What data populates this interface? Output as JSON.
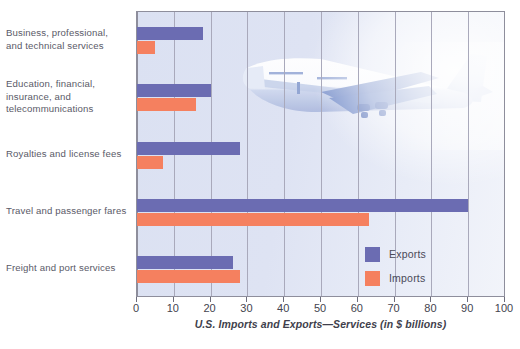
{
  "chart_data": {
    "type": "bar",
    "orientation": "horizontal",
    "title": "",
    "xlabel": "U.S. Imports and Exports—Services (in $ billions)",
    "ylabel": "",
    "xlim": [
      0,
      100
    ],
    "xticks": [
      0,
      10,
      20,
      30,
      40,
      50,
      60,
      70,
      80,
      90,
      100
    ],
    "xtick_labels": [
      "0",
      "10",
      "20",
      "30",
      "40",
      "50",
      "60",
      "70",
      "80",
      "90",
      "100"
    ],
    "grid": true,
    "grid_axis": "x",
    "legend_position": "inside-lower-right",
    "categories": [
      "Business, professional, and technical services",
      "Education, financial, insurance, and telecommunications",
      "Royalties and license fees",
      "Travel and passenger fares",
      "Freight and port services"
    ],
    "series": [
      {
        "name": "Exports",
        "color": "#6b6cb2",
        "values": [
          18,
          20,
          28,
          90,
          26
        ]
      },
      {
        "name": "Imports",
        "color": "#f5805f",
        "values": [
          5,
          16,
          7,
          63,
          28
        ]
      }
    ]
  },
  "category_labels": [
    {
      "lines": [
        "Business, professional,",
        "and technical services"
      ]
    },
    {
      "lines": [
        "Education, financial,",
        "insurance, and",
        "telecommunications"
      ]
    },
    {
      "lines": [
        "Royalties and license fees"
      ]
    },
    {
      "lines": [
        "Travel and passenger fares"
      ]
    },
    {
      "lines": [
        "Freight and port services"
      ]
    }
  ],
  "legend": {
    "items": [
      {
        "label": "Exports",
        "color": "#6b6cb2"
      },
      {
        "label": "Imports",
        "color": "#f5805f"
      }
    ]
  },
  "axis": {
    "title": "U.S. Imports and Exports—Services (in $ billions)"
  },
  "decoration": {
    "image_name": "airplane-photo",
    "description": "jet airliner"
  },
  "colors": {
    "exports": "#6b6cb2",
    "imports": "#f5805f",
    "plot_background": "#dde2f2",
    "gridline": "#a9a9bb",
    "frame": "#8e8e9c",
    "text": "#4a4a58"
  }
}
